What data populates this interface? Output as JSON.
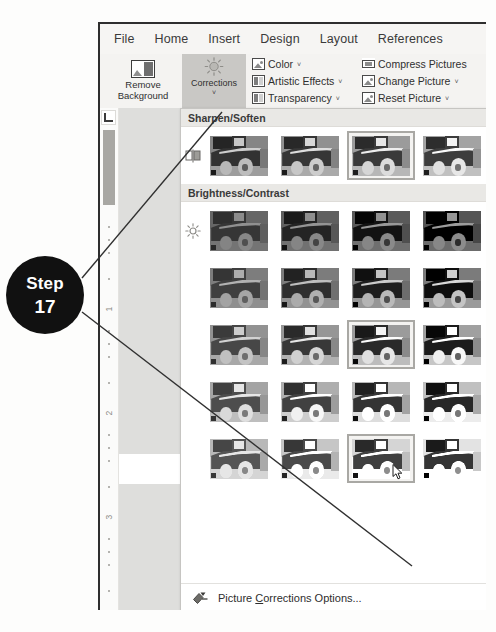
{
  "callout": {
    "line1": "Step",
    "line2": "17"
  },
  "ribbon": {
    "tabs": [
      {
        "label": "File"
      },
      {
        "label": "Home"
      },
      {
        "label": "Insert"
      },
      {
        "label": "Design"
      },
      {
        "label": "Layout"
      },
      {
        "label": "References"
      }
    ],
    "buttons": [
      {
        "name": "remove-background",
        "line1": "Remove",
        "line2": "Background",
        "icon": "picture-icon"
      },
      {
        "name": "corrections",
        "line1": "Corrections",
        "line2": "",
        "icon": "sun-icon",
        "dropdown": "˅",
        "state": "active"
      }
    ],
    "commands_col1": [
      {
        "label": "Color",
        "icon": "color-picture-icon",
        "dropdown": "˅"
      },
      {
        "label": "Artistic Effects",
        "icon": "artistic-effects-icon",
        "dropdown": "˅"
      },
      {
        "label": "Transparency",
        "icon": "transparency-icon",
        "dropdown": "˅"
      }
    ],
    "commands_col2": [
      {
        "label": "Compress Pictures",
        "icon": "compress-pictures-icon",
        "dropdown": ""
      },
      {
        "label": "Change Picture",
        "icon": "change-picture-icon",
        "dropdown": "˅"
      },
      {
        "label": "Reset Picture",
        "icon": "reset-picture-icon",
        "dropdown": "˅"
      }
    ]
  },
  "gallery": {
    "sections": [
      {
        "title": "Sharpen/Soften",
        "icon": "sharpen-icon",
        "rows": [
          {
            "cells": [
              {
                "selected": false,
                "tone": "soft-1"
              },
              {
                "selected": false,
                "tone": "soft-2"
              },
              {
                "selected": true,
                "tone": "soft-3"
              },
              {
                "selected": false,
                "tone": "soft-4"
              }
            ]
          }
        ]
      },
      {
        "title": "Brightness/Contrast",
        "icon": "brightness-icon",
        "rows": [
          {
            "cells": [
              {
                "selected": false,
                "tone": "b-00"
              },
              {
                "selected": false,
                "tone": "b-01"
              },
              {
                "selected": false,
                "tone": "b-02"
              },
              {
                "selected": false,
                "tone": "b-03"
              }
            ]
          },
          {
            "cells": [
              {
                "selected": false,
                "tone": "b-10"
              },
              {
                "selected": false,
                "tone": "b-11"
              },
              {
                "selected": false,
                "tone": "b-12"
              },
              {
                "selected": false,
                "tone": "b-13"
              }
            ]
          },
          {
            "cells": [
              {
                "selected": false,
                "tone": "b-20"
              },
              {
                "selected": false,
                "tone": "b-21"
              },
              {
                "selected": true,
                "tone": "b-22"
              },
              {
                "selected": false,
                "tone": "b-23"
              }
            ]
          },
          {
            "cells": [
              {
                "selected": false,
                "tone": "b-30"
              },
              {
                "selected": false,
                "tone": "b-31"
              },
              {
                "selected": false,
                "tone": "b-32"
              },
              {
                "selected": false,
                "tone": "b-33"
              }
            ]
          },
          {
            "cells": [
              {
                "selected": false,
                "tone": "b-40"
              },
              {
                "selected": false,
                "tone": "b-41"
              },
              {
                "selected": true,
                "tone": "b-42",
                "cursor": true
              },
              {
                "selected": false,
                "tone": "b-43"
              }
            ]
          }
        ]
      }
    ],
    "footer": {
      "icon": "picture-corrections-options-icon",
      "label_before": "Picture ",
      "label_accel": "C",
      "label_after": "orrections Options..."
    }
  },
  "ruler": {
    "tab_selector": "L",
    "marks": [
      "1",
      "2",
      "3"
    ]
  }
}
